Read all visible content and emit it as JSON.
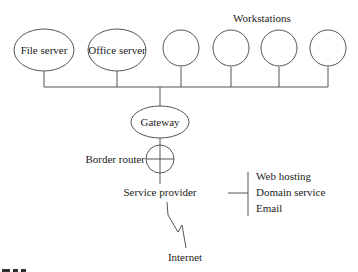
{
  "diagram": {
    "workstations_label": "Workstations",
    "nodes": {
      "file_server": "File server",
      "office_server": "Office server",
      "gateway": "Gateway",
      "border_router": "Border router",
      "service_provider": "Service provider",
      "internet": "Internet"
    },
    "workstations_count": 4,
    "services": [
      "Web hosting",
      "Domain service",
      "Email"
    ]
  }
}
